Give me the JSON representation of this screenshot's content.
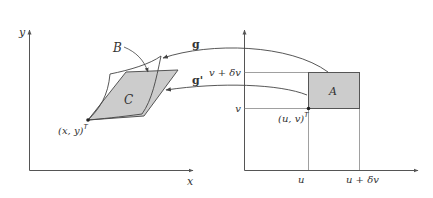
{
  "diagram": {
    "type": "coordinate-transformation",
    "left_panel": {
      "axes": {
        "x_label": "x",
        "y_label": "y"
      },
      "point_label": "(x, y)",
      "point_superscript": "T",
      "region_C_label": "C",
      "region_B_label": "B"
    },
    "right_panel": {
      "axes": {
        "x_ticks": [
          "u",
          "u + δv"
        ],
        "y_ticks": [
          "v",
          "v + δv"
        ]
      },
      "point_label": "(u, v)",
      "point_superscript": "T",
      "region_A_label": "A"
    },
    "mappings": [
      {
        "name": "g",
        "label": "g",
        "from": "A",
        "to": "B"
      },
      {
        "name": "g_prime",
        "label": "g'",
        "from": "A",
        "to": "C"
      }
    ],
    "colors": {
      "axis": "#555555",
      "fill_region": "#cccccc",
      "stroke": "#444444",
      "guide_line": "#888888",
      "text": "#333333"
    }
  }
}
